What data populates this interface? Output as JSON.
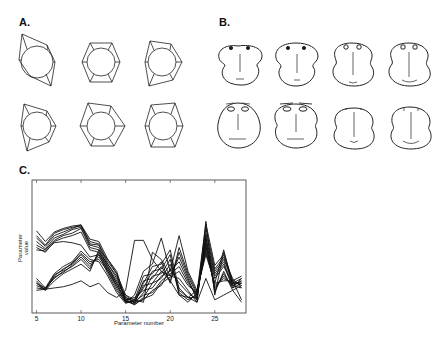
{
  "panels": {
    "a": {
      "label": "A.",
      "description": "Polygon glyphs",
      "glyph_count": 6
    },
    "b": {
      "label": "B.",
      "description": "Chernoff faces",
      "glyph_count": 8
    },
    "c": {
      "label": "C.",
      "description": "Parallel-coordinate parameter profiles"
    }
  },
  "chart_data": {
    "type": "line",
    "title": "",
    "xlabel": "Parameter number",
    "ylabel": "Parameter value",
    "xlim": [
      4.5,
      28.5
    ],
    "ylim": [
      0,
      1
    ],
    "xticks": [
      5,
      10,
      15,
      20,
      25
    ],
    "grid": false,
    "legend": null,
    "x": [
      5,
      6,
      7,
      8,
      9,
      10,
      11,
      12,
      13,
      14,
      15,
      16,
      17,
      18,
      19,
      20,
      21,
      22,
      23,
      24,
      25,
      26,
      27,
      28
    ],
    "series": [
      {
        "name": "s1",
        "values": [
          0.64,
          0.55,
          0.63,
          0.66,
          0.68,
          0.69,
          0.57,
          0.55,
          0.4,
          0.3,
          0.05,
          0.02,
          0.07,
          0.1,
          0.2,
          0.25,
          0.3,
          0.18,
          0.12,
          0.7,
          0.35,
          0.44,
          0.22,
          0.18
        ]
      },
      {
        "name": "s2",
        "values": [
          0.6,
          0.52,
          0.62,
          0.65,
          0.67,
          0.68,
          0.55,
          0.53,
          0.38,
          0.28,
          0.04,
          0.05,
          0.1,
          0.12,
          0.22,
          0.28,
          0.34,
          0.2,
          0.1,
          0.66,
          0.32,
          0.42,
          0.2,
          0.2
        ]
      },
      {
        "name": "s3",
        "values": [
          0.58,
          0.51,
          0.6,
          0.63,
          0.66,
          0.69,
          0.53,
          0.52,
          0.36,
          0.26,
          0.06,
          0.08,
          0.14,
          0.16,
          0.26,
          0.3,
          0.38,
          0.22,
          0.08,
          0.62,
          0.3,
          0.4,
          0.24,
          0.16
        ]
      },
      {
        "name": "s4",
        "values": [
          0.55,
          0.49,
          0.58,
          0.61,
          0.65,
          0.67,
          0.52,
          0.5,
          0.34,
          0.22,
          0.08,
          0.04,
          0.18,
          0.2,
          0.3,
          0.26,
          0.42,
          0.24,
          0.06,
          0.58,
          0.28,
          0.38,
          0.18,
          0.22
        ]
      },
      {
        "name": "s5",
        "values": [
          0.52,
          0.48,
          0.56,
          0.6,
          0.62,
          0.66,
          0.5,
          0.48,
          0.32,
          0.2,
          0.1,
          0.03,
          0.22,
          0.24,
          0.34,
          0.22,
          0.46,
          0.26,
          0.1,
          0.54,
          0.26,
          0.36,
          0.16,
          0.24
        ]
      },
      {
        "name": "s6",
        "values": [
          0.5,
          0.46,
          0.55,
          0.58,
          0.6,
          0.63,
          0.48,
          0.46,
          0.3,
          0.18,
          0.06,
          0.06,
          0.26,
          0.28,
          0.38,
          0.2,
          0.5,
          0.28,
          0.12,
          0.5,
          0.24,
          0.34,
          0.2,
          0.2
        ]
      },
      {
        "name": "s7",
        "values": [
          0.48,
          0.47,
          0.54,
          0.55,
          0.54,
          0.52,
          0.42,
          0.44,
          0.28,
          0.14,
          0.04,
          0.1,
          0.3,
          0.36,
          0.58,
          0.3,
          0.6,
          0.3,
          0.14,
          0.46,
          0.2,
          0.48,
          0.18,
          0.16
        ]
      },
      {
        "name": "s8",
        "values": [
          0.2,
          0.14,
          0.22,
          0.28,
          0.32,
          0.36,
          0.3,
          0.48,
          0.4,
          0.28,
          0.1,
          0.06,
          0.04,
          0.46,
          0.4,
          0.26,
          0.24,
          0.14,
          0.04,
          0.72,
          0.1,
          0.46,
          0.22,
          0.06
        ]
      },
      {
        "name": "s9",
        "values": [
          0.24,
          0.16,
          0.24,
          0.3,
          0.34,
          0.4,
          0.32,
          0.46,
          0.36,
          0.24,
          0.08,
          0.04,
          0.06,
          0.14,
          0.18,
          0.32,
          0.2,
          0.12,
          0.06,
          0.6,
          0.12,
          0.3,
          0.14,
          0.18
        ]
      },
      {
        "name": "s10",
        "values": [
          0.18,
          0.15,
          0.25,
          0.29,
          0.35,
          0.42,
          0.34,
          0.44,
          0.34,
          0.2,
          0.06,
          0.02,
          0.08,
          0.2,
          0.24,
          0.36,
          0.16,
          0.08,
          0.08,
          0.56,
          0.14,
          0.28,
          0.16,
          0.2
        ]
      },
      {
        "name": "s11",
        "values": [
          0.22,
          0.14,
          0.26,
          0.32,
          0.36,
          0.44,
          0.36,
          0.42,
          0.32,
          0.18,
          0.05,
          0.03,
          0.12,
          0.26,
          0.28,
          0.4,
          0.12,
          0.06,
          0.1,
          0.52,
          0.16,
          0.26,
          0.18,
          0.22
        ]
      },
      {
        "name": "s12",
        "values": [
          0.16,
          0.15,
          0.27,
          0.31,
          0.37,
          0.45,
          0.38,
          0.4,
          0.3,
          0.16,
          0.04,
          0.05,
          0.16,
          0.3,
          0.32,
          0.44,
          0.1,
          0.04,
          0.12,
          0.48,
          0.18,
          0.24,
          0.2,
          0.24
        ]
      },
      {
        "name": "s13",
        "values": [
          0.2,
          0.16,
          0.28,
          0.34,
          0.38,
          0.47,
          0.4,
          0.38,
          0.26,
          0.12,
          0.03,
          0.06,
          0.2,
          0.34,
          0.36,
          0.48,
          0.14,
          0.08,
          0.14,
          0.44,
          0.2,
          0.22,
          0.22,
          0.26
        ]
      },
      {
        "name": "s14",
        "values": [
          0.14,
          0.15,
          0.16,
          0.17,
          0.19,
          0.22,
          0.17,
          0.2,
          0.12,
          0.08,
          0.14,
          0.56,
          0.56,
          0.4,
          0.3,
          0.22,
          0.1,
          0.08,
          0.04,
          0.24,
          0.06,
          0.1,
          0.14,
          0.04
        ]
      }
    ]
  }
}
